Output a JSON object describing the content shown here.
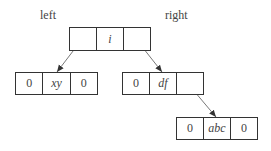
{
  "labels": {
    "left": "left",
    "right": "right"
  },
  "nodes": {
    "root": {
      "left_ptr": "",
      "data": "i",
      "right_ptr": ""
    },
    "left_child": {
      "left_ptr": "0",
      "data": "xy",
      "right_ptr": "0"
    },
    "right_child": {
      "left_ptr": "0",
      "data": "df",
      "right_ptr": ""
    },
    "right_right_child": {
      "left_ptr": "0",
      "data": "abc",
      "right_ptr": "0"
    }
  },
  "colors": {
    "line": "#333333",
    "text": "#444444",
    "background": "#ffffff"
  }
}
